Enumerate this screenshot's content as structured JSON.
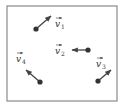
{
  "diagram": {
    "frame": {
      "x": 7,
      "y": 6,
      "width": 110,
      "height": 95,
      "stroke": "#8a8a8a"
    },
    "colors": {
      "dot": "#333333",
      "arrow": "#444444",
      "label": "#333333"
    },
    "vectors": [
      {
        "id": "v1",
        "symbol": "v",
        "subscript": "1",
        "dot": [
          36,
          29
        ],
        "tip": [
          51,
          16
        ],
        "label_pos": [
          55,
          27
        ]
      },
      {
        "id": "v2",
        "symbol": "v",
        "subscript": "2",
        "dot": [
          88,
          50
        ],
        "tip": [
          72,
          50
        ],
        "label_pos": [
          55,
          54
        ]
      },
      {
        "id": "v3",
        "symbol": "v",
        "subscript": "3",
        "dot": [
          98,
          81
        ],
        "tip": [
          111,
          70
        ],
        "label_pos": [
          96,
          67
        ]
      },
      {
        "id": "v4",
        "symbol": "v",
        "subscript": "4",
        "dot": [
          40,
          82
        ],
        "tip": [
          26,
          70
        ],
        "label_pos": [
          16,
          62
        ]
      }
    ]
  }
}
